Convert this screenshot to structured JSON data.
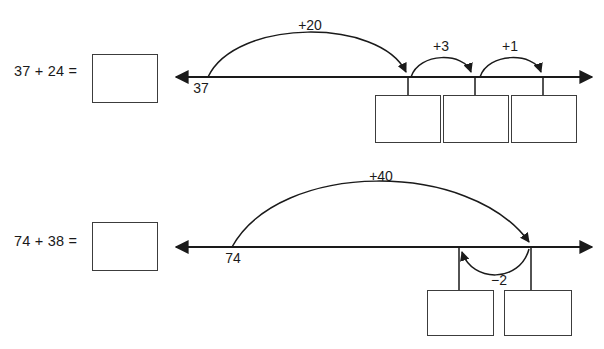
{
  "page": {
    "background_color": "#ffffff",
    "ink_color": "#1a1a1a",
    "box_border_color": "#3c3c3c",
    "width": 604,
    "height": 349
  },
  "problems": [
    {
      "id": "problem-1",
      "equation": "37 + 24 =",
      "answer_value": "",
      "start_label": "37",
      "jumps": [
        {
          "label": "+20",
          "value": 20,
          "direction": "right"
        },
        {
          "label": "+3",
          "value": 3,
          "direction": "right"
        },
        {
          "label": "+1",
          "value": 1,
          "direction": "right"
        }
      ],
      "step_boxes": [
        {
          "value": ""
        },
        {
          "value": ""
        },
        {
          "value": ""
        }
      ]
    },
    {
      "id": "problem-2",
      "equation": "74 + 38 =",
      "answer_value": "",
      "start_label": "74",
      "jumps": [
        {
          "label": "+40",
          "value": 40,
          "direction": "right"
        },
        {
          "label": "−2",
          "value": -2,
          "direction": "left"
        }
      ],
      "step_boxes": [
        {
          "value": ""
        },
        {
          "value": ""
        }
      ]
    }
  ]
}
